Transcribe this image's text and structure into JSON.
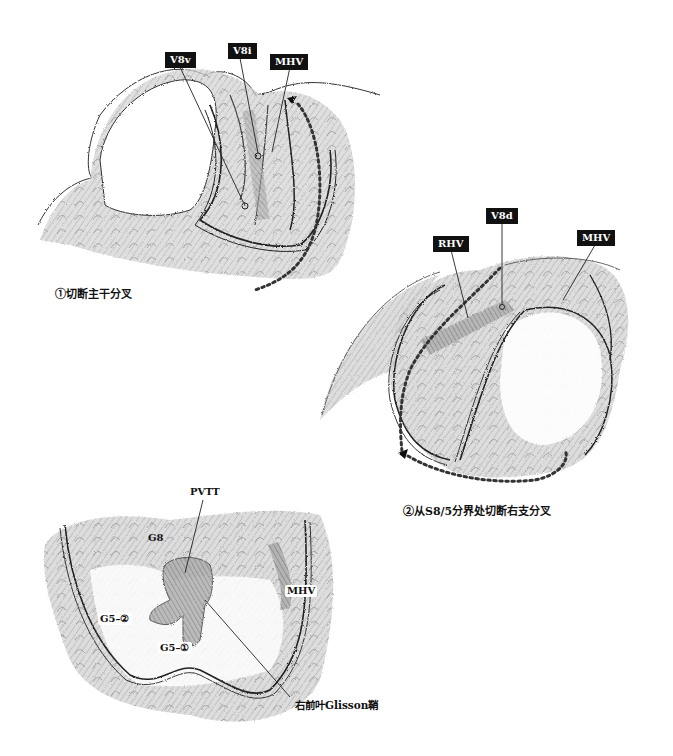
{
  "figure1": {
    "caption": "①切断主干分叉",
    "labels": {
      "v8v": "V8v",
      "v8i": "V8i",
      "mhv": "MHV"
    }
  },
  "figure2": {
    "caption": "②从S8/5分界处切断右支分叉",
    "labels": {
      "rhv": "RHV",
      "v8d": "V8d",
      "mhv": "MHV"
    }
  },
  "figure3": {
    "labels": {
      "pvtt": "PVTT",
      "g8": "G8",
      "mhv": "MHV",
      "g5_2": "G5–②",
      "g5_1": "G5–①",
      "glisson": "右前叶Glisson鞘"
    }
  },
  "colors": {
    "label_bg": "#111111",
    "label_text": "#ffffff",
    "line": "#222222",
    "dotted_path": "#333333",
    "shading": "#b5b5b5",
    "shading_dark": "#8c8c8c"
  }
}
